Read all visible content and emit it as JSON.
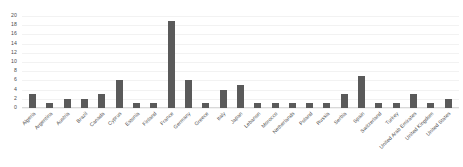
{
  "chart_data": {
    "type": "bar",
    "title": "",
    "subtitle": "",
    "xlabel": "",
    "ylabel": "",
    "ylim": [
      0,
      20
    ],
    "ytick_step": 2,
    "yticks": [
      20,
      18,
      16,
      14,
      12,
      10,
      8,
      6,
      4,
      2,
      0
    ],
    "grid": true,
    "legend": false,
    "legend_position": "none",
    "bar_color": "#5a5a5a",
    "categories": [
      "Algeria",
      "Argentina",
      "Austria",
      "Brazil",
      "Canada",
      "Cyprus",
      "Estonia",
      "Finland",
      "France",
      "Germany",
      "Greece",
      "Italy",
      "Japan",
      "Lebanon",
      "Morocco",
      "Netherlands",
      "Poland",
      "Russia",
      "Serbia",
      "Spain",
      "Switzerland",
      "Turkey",
      "United Arab Emirates",
      "United Kingdom",
      "United States"
    ],
    "values": [
      3,
      1,
      2,
      2,
      3,
      6,
      1,
      1,
      19,
      6,
      1,
      4,
      5,
      1,
      1,
      1,
      1,
      1,
      3,
      7,
      1,
      1,
      3,
      1,
      2
    ]
  }
}
